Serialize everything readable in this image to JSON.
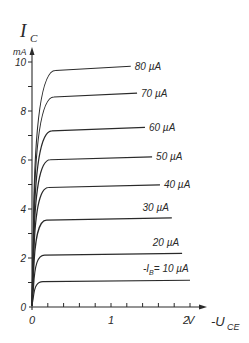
{
  "chart_data": {
    "type": "line",
    "title": "",
    "ylabel": "I_C",
    "ylabel_main": "I",
    "ylabel_sub": "C",
    "yunit": "mA",
    "xlabel": "-U_CE",
    "xlabel_main": "-U",
    "xlabel_sub": "CE",
    "xunit": "V",
    "xlim": [
      0,
      2
    ],
    "ylim": [
      0,
      10
    ],
    "x_ticks_labeled": [
      "0",
      "1",
      "2"
    ],
    "x_minor_step": 0.2,
    "y_ticks_labeled": [
      "0",
      "2",
      "4",
      "6",
      "8",
      "10"
    ],
    "y_minor_step": 1,
    "grid": false,
    "legend": "inline labels at curve ends",
    "series": [
      {
        "name": "-I_B = 10 µA",
        "label": "= 10 µA",
        "label_prefix": "-I",
        "label_sub": "B",
        "ib_uA": 10,
        "saturation_mA": 1.05,
        "x_end": 2.0
      },
      {
        "name": "20 µA",
        "label": "20 µA",
        "ib_uA": 20,
        "saturation_mA": 2.15,
        "x_end": 1.9
      },
      {
        "name": "30 µA",
        "label": "30 µA",
        "ib_uA": 30,
        "saturation_mA": 3.6,
        "x_end": 1.77
      },
      {
        "name": "40 µA",
        "label": "40 µA",
        "ib_uA": 40,
        "saturation_mA": 4.95,
        "x_end": 1.62
      },
      {
        "name": "50 µA",
        "label": "50 µA",
        "ib_uA": 50,
        "saturation_mA": 6.1,
        "x_end": 1.52
      },
      {
        "name": "60 µA",
        "label": "60 µA",
        "ib_uA": 60,
        "saturation_mA": 7.3,
        "x_end": 1.43
      },
      {
        "name": "70 µA",
        "label": "70 µA",
        "ib_uA": 70,
        "saturation_mA": 8.7,
        "x_end": 1.33
      },
      {
        "name": "80 µA",
        "label": "80 µA",
        "ib_uA": 80,
        "saturation_mA": 9.8,
        "x_end": 1.25
      }
    ]
  },
  "style": {
    "ink": "#2a2a2a",
    "background": "#ffffff"
  }
}
